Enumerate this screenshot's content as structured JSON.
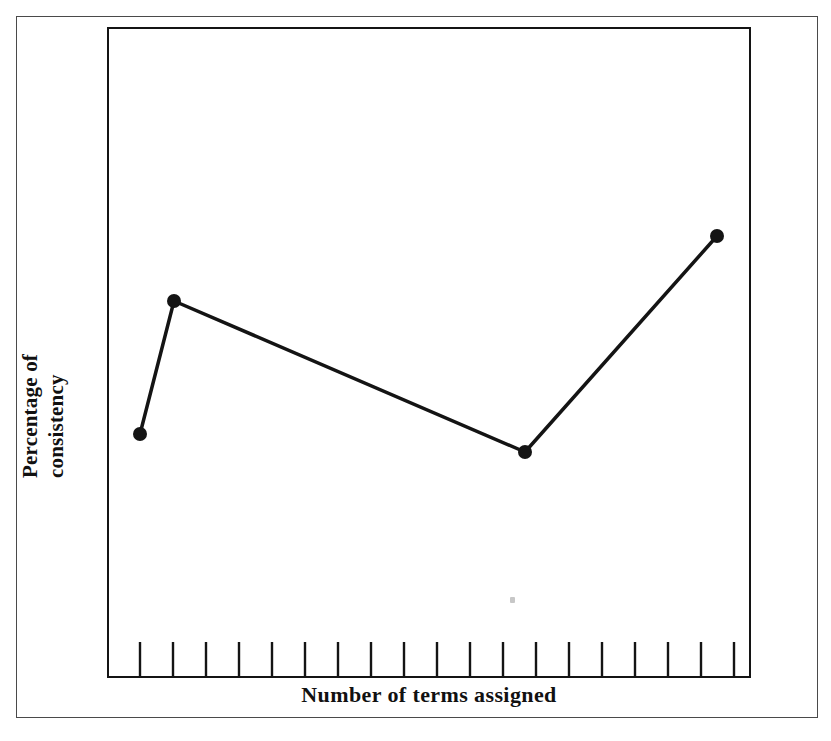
{
  "figure": {
    "background_color": "#ffffff",
    "ink_color": "#141414",
    "outer_border_color": "#4a4a4a",
    "x_axis_label": "Number of terms assigned",
    "y_axis_label_line1": "Percentage of",
    "y_axis_label_line2": "consistency",
    "speck_name": "scan-speck"
  },
  "chart_data": {
    "type": "line",
    "title": "",
    "xlabel": "Number of terms assigned",
    "ylabel": "Percentage of consistency",
    "grid": false,
    "legend": null,
    "axis_ticks_labeled": false,
    "x_tick_count": 20,
    "x_tick_pixel_start": 140,
    "x_tick_pixel_spacing": 33,
    "xlim_pixels": [
      107,
      751
    ],
    "ylim_pixels": [
      27,
      678
    ],
    "marker": "filled-circle",
    "marker_radius_px": 7,
    "line_width_px": 3.5,
    "x": [
      1,
      2,
      12,
      18
    ],
    "y": [
      37.4,
      57.9,
      34.7,
      67.9
    ],
    "points_pixels": [
      {
        "x": 140,
        "y": 434
      },
      {
        "x": 174,
        "y": 301
      },
      {
        "x": 525,
        "y": 452
      },
      {
        "x": 717,
        "y": 236
      }
    ],
    "series": [
      {
        "name": "Percentage of consistency",
        "values": [
          37.4,
          57.9,
          34.7,
          67.9
        ]
      }
    ],
    "categories": [
      "1",
      "2",
      "12",
      "18"
    ]
  }
}
